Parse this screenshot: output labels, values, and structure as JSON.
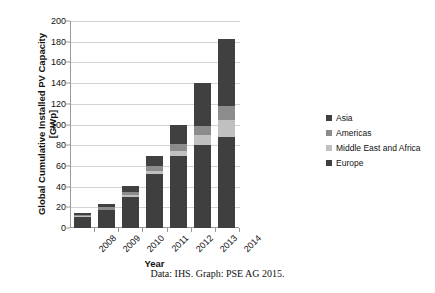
{
  "chart_data": {
    "type": "bar",
    "stacked": true,
    "title": "",
    "xlabel": "Year",
    "ylabel": "Global Cumulative Installed PV Capacity [GWp]",
    "categories": [
      "2008",
      "2009",
      "2010",
      "2011",
      "2012",
      "2013",
      "2014"
    ],
    "ylim": [
      0,
      200
    ],
    "yticks": [
      0,
      20,
      40,
      60,
      80,
      100,
      120,
      140,
      160,
      180,
      200
    ],
    "grid": true,
    "legend_position": "right",
    "series": [
      {
        "name": "Europe",
        "color": "#3f3f3f",
        "values": [
          11,
          17,
          30,
          52,
          70,
          80,
          88
        ]
      },
      {
        "name": "Middle East and Africa",
        "color": "#c0c0c0",
        "values": [
          0.5,
          0.8,
          1.5,
          3,
          4,
          10,
          16
        ]
      },
      {
        "name": "Americas",
        "color": "#8c8c8c",
        "values": [
          1.5,
          2.2,
          3.5,
          5,
          7,
          9,
          14
        ]
      },
      {
        "name": "Asia",
        "color": "#404040",
        "values": [
          2,
          3,
          6,
          10,
          19,
          41,
          65
        ]
      }
    ],
    "totals": [
      15,
      23,
      41,
      70,
      100,
      140,
      183
    ],
    "annotations": {
      "caption": "Data: IHS. Graph: PSE AG 2015."
    }
  },
  "legend": {
    "items": [
      {
        "label": "Asia",
        "color": "#404040"
      },
      {
        "label": "Americas",
        "color": "#8c8c8c"
      },
      {
        "label": "Middle East and Africa",
        "color": "#c0c0c0"
      },
      {
        "label": "Europe",
        "color": "#3f3f3f"
      }
    ]
  },
  "axes": {
    "y_title": "Global Cumulative Installed PV Capacity [GWp]",
    "x_title": "Year",
    "y_ticks": [
      "200",
      "180",
      "160",
      "140",
      "120",
      "100",
      "80",
      "60",
      "40",
      "20",
      "0"
    ],
    "x_ticks": [
      "2008",
      "2009",
      "2010",
      "2011",
      "2012",
      "2013",
      "2014"
    ]
  },
  "caption": {
    "text": "Data: IHS. Graph: PSE AG 2015."
  }
}
